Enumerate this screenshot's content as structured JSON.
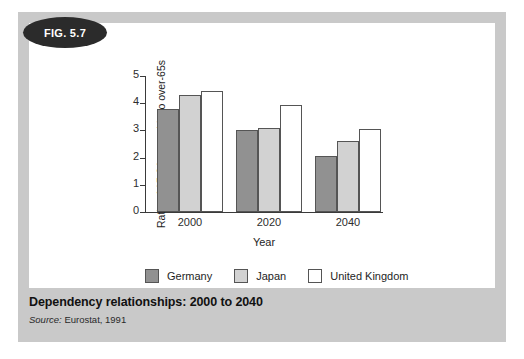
{
  "figure": {
    "badge_label": "FIG. 5.7",
    "caption_title": "Dependency relationships: 2000 to 2040",
    "source_prefix": "Source:",
    "source_text": "Eurostat, 1991"
  },
  "colors": {
    "frame": "#c9c9c9",
    "canvas": "#ffffff",
    "badge": "#2b2b2b",
    "germany": "#919191",
    "japan": "#d2d2d2",
    "united_kingdom": "#ffffff",
    "bar_outline": "#555555",
    "axis": "#3a3a3a"
  },
  "chart_data": {
    "type": "bar",
    "title": "Dependency relationships: 2000 to 2040",
    "xlabel": "Year",
    "ylabel": "Ratio of 15-64-year-olds to over-65s",
    "categories": [
      "2000",
      "2020",
      "2040"
    ],
    "ylim": [
      0,
      5
    ],
    "yticks": [
      "0",
      "1",
      "2",
      "3",
      "4",
      "5"
    ],
    "grid": false,
    "legend_position": "bottom",
    "series": [
      {
        "name": "Germany",
        "values": [
          3.8,
          3.0,
          2.05
        ]
      },
      {
        "name": "Japan",
        "values": [
          4.3,
          3.08,
          2.6
        ]
      },
      {
        "name": "United Kingdom",
        "values": [
          4.45,
          3.95,
          3.05
        ]
      }
    ]
  }
}
